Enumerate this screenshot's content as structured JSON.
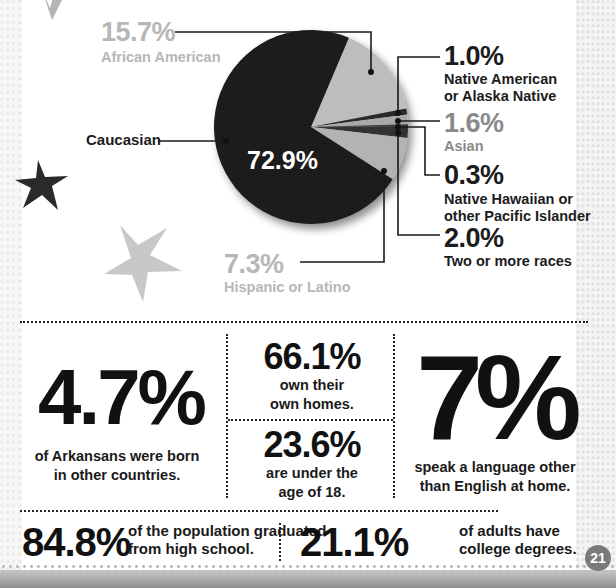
{
  "chart_data": {
    "type": "pie",
    "title": "",
    "slices": [
      {
        "label": "African American",
        "value": 15.7,
        "display": "15.7%",
        "shade": "#bdbdbd"
      },
      {
        "label": "Native American or Alaska Native",
        "value": 1.0,
        "display": "1.0%",
        "shade": "#2a2a2a"
      },
      {
        "label": "Asian",
        "value": 1.6,
        "display": "1.6%",
        "shade": "#a9a9a9"
      },
      {
        "label": "Native Hawaiian or other Pacific Islander",
        "value": 0.3,
        "display": "0.3%",
        "shade": "#3a3a3a"
      },
      {
        "label": "Two or more races",
        "value": 2.0,
        "display": "2.0%",
        "shade": "#333333"
      },
      {
        "label": "Hispanic or Latino",
        "value": 7.3,
        "display": "7.3%",
        "shade": "#b3b3b3"
      },
      {
        "label": "Caucasian",
        "value": 72.9,
        "display": "72.9%",
        "shade": "#1f1f1f"
      }
    ],
    "legend": "callouts"
  },
  "pie_labels": {
    "african_american": {
      "pct": "15.7%",
      "name": "African American"
    },
    "caucasian": {
      "name": "Caucasian",
      "pct": "72.9%"
    },
    "native_american": {
      "pct": "1.0%",
      "name_line1": "Native American",
      "name_line2": "or Alaska Native"
    },
    "asian": {
      "pct": "1.6%",
      "name": "Asian"
    },
    "hawaiian": {
      "pct": "0.3%",
      "name_line1": "Native Hawaiian or",
      "name_line2": "other Pacific Islander"
    },
    "two_or_more": {
      "pct": "2.0%",
      "name": "Two or more races"
    },
    "hispanic": {
      "pct": "7.3%",
      "name": "Hispanic or Latino"
    }
  },
  "stats": {
    "foreign_born": {
      "value": "4.7%",
      "line1": "of Arkansans were born",
      "line2": "in other countries."
    },
    "homeowners": {
      "value": "66.1%",
      "line1": "own their",
      "line2": "own homes."
    },
    "under_18": {
      "value": "23.6%",
      "line1": "are under the",
      "line2": "age of 18."
    },
    "other_language": {
      "value": "7%",
      "line1": "speak a language other",
      "line2": "than English at home."
    },
    "high_school": {
      "value": "84.8%",
      "line1": "of the population graduated",
      "line2": "from high school."
    },
    "college": {
      "value": "21.1%",
      "line1": "of adults have",
      "line2": "college degrees."
    }
  },
  "page_number": "21",
  "colors": {
    "ink": "#1a1a1a",
    "light_gray": "#b7b7b7",
    "mid_gray": "#8a8a8a",
    "badge": "#7a7a7a"
  }
}
